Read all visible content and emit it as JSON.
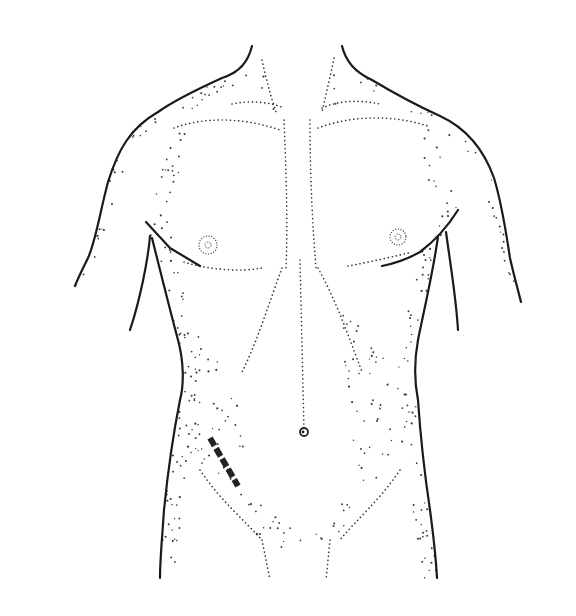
{
  "figure": {
    "type": "anatomical-illustration",
    "annotation": "dashed incision line, lower right abdomen (patient's right)",
    "colors": {
      "background": "#ffffff",
      "ink": "#1a1a1a",
      "stipple": "#3a3a3a",
      "incision": "#222222"
    },
    "outlines": {
      "left_shoulder": "M252 46 C 248 62, 240 72, 222 78 C 200 88, 175 100, 158 112 C 130 128, 118 150, 108 182 C 100 212, 96 240, 88 258 C 82 270, 78 278, 75 286",
      "right_shoulder": "M342 46 C 346 62, 355 72, 372 80 C 392 92, 418 106, 440 116 C 466 128, 484 150, 494 178 C 502 204, 506 232, 510 258 C 514 276, 518 290, 521 302",
      "left_axilla": "M146 222 L 170 248 L 200 266",
      "left_arm_inner": "M150 236 C 148 260, 140 300, 130 330",
      "left_flank": "M152 238 C 160 270, 170 310, 178 340 C 184 362, 184 385, 180 400 C 174 430, 168 470, 164 510 C 162 540, 160 560, 160 578",
      "right_axilla": "M458 210 C 448 226, 436 240, 420 252 C 406 260, 392 264, 382 266",
      "right_arm_inner": "M446 232 C 450 262, 456 296, 458 330",
      "right_flank": "M438 236 C 434 268, 424 310, 418 340 C 414 362, 414 380, 418 400 C 420 430, 424 470, 430 510 C 434 540, 436 560, 437 578"
    },
    "dotted_lines": {
      "left_clavicle": "M232 104 C 250 100, 270 102, 284 108",
      "right_clavicle": "M322 108 C 340 100, 360 100, 380 104",
      "left_pec_top": "M174 128 C 200 118, 240 116, 280 130",
      "right_pec_top": "M318 128 C 350 116, 390 114, 428 126",
      "sternum_left": "M284 120 C 286 170, 288 220, 286 268",
      "sternum_right": "M310 120 C 310 170, 312 220, 316 268",
      "left_pec_bottom": "M184 262 C 210 270, 240 272, 262 268",
      "right_pec_bottom": "M348 266 C 370 262, 396 256, 412 252",
      "costal_left": "M282 268 C 270 300, 258 340, 242 372",
      "costal_right": "M318 268 C 336 300, 350 340, 362 372",
      "linea_alba": "M300 260 L 304 430",
      "left_scm": "M262 60 C 266 78, 270 94, 276 112",
      "right_scm": "M334 58 C 330 78, 326 94, 322 112",
      "left_inguinal": "M200 470 C 220 500, 244 520, 262 540",
      "right_inguinal": "M400 470 C 380 500, 356 520, 340 540",
      "left_thigh": "M262 540 L 270 580",
      "right_thigh": "M330 540 L 326 580"
    },
    "nipples": [
      {
        "side": "left",
        "cx": 208,
        "cy": 245,
        "inner_r": 3,
        "outer_r": 9
      },
      {
        "side": "right",
        "cx": 398,
        "cy": 237,
        "inner_r": 3,
        "outer_r": 8
      }
    ],
    "navel": {
      "cx": 304,
      "cy": 432,
      "r": 4
    },
    "incision": {
      "start": [
        210,
        438
      ],
      "end": [
        238,
        486
      ],
      "segments": 5,
      "stroke_width": 6,
      "dasharray": "9 3"
    },
    "stipple_regions": [
      {
        "name": "left-shoulder-shade",
        "d": "M252 46 C 248 62, 240 72, 222 78 C 200 88, 175 100, 158 112 C 130 128, 118 150, 108 182 C 100 212, 96 240, 88 258 L 78 284 L 92 270 C 106 236, 116 196, 126 166 C 140 132, 190 110, 236 86 C 250 78, 256 64, 252 46 Z",
        "density": 0.55
      },
      {
        "name": "right-shoulder-shade",
        "d": "M342 46 C 346 62, 355 72, 372 80 C 392 92, 418 106, 440 116 C 466 128, 484 150, 494 178 C 502 204, 506 232, 510 258 L 520 300 L 504 270 C 496 236, 490 206, 480 180 C 470 152, 420 116, 372 92 C 352 80, 342 66, 342 46 Z",
        "density": 0.5
      },
      {
        "name": "left-flank-shade",
        "d": "M152 238 C 160 270, 170 310, 178 340 C 184 362, 184 385, 180 400 C 174 430, 168 470, 164 510 C 162 540, 160 560, 160 578 L 176 578 C 176 540, 182 500, 196 460 C 206 430, 204 380, 196 340 C 188 300, 180 270, 170 240 Z",
        "density": 0.6
      },
      {
        "name": "right-flank-shade",
        "d": "M438 236 C 434 268, 424 310, 418 340 C 414 362, 414 380, 418 400 C 420 430, 424 470, 430 510 C 434 540, 436 560, 437 578 L 420 578 C 418 540, 412 500, 404 460 C 396 420, 396 380, 402 340 C 410 300, 420 270, 424 240 Z",
        "density": 0.6
      },
      {
        "name": "left-pec-shade",
        "d": "M150 200 C 160 170, 170 140, 180 130 L 196 134 C 182 160, 170 200, 176 240 L 150 236 Z",
        "density": 0.5
      },
      {
        "name": "right-pec-shade",
        "d": "M428 126 C 440 150, 450 190, 458 210 L 440 240 C 432 210, 424 170, 412 140 Z",
        "density": 0.55
      },
      {
        "name": "lower-abdomen-shade",
        "d": "M230 470 C 250 500, 280 520, 300 530 C 320 520, 350 500, 370 470 C 380 450, 400 420, 410 400 C 396 440, 380 480, 340 540 C 320 560, 290 560, 262 540 C 240 520, 230 500, 230 470 Z",
        "density": 0.45
      },
      {
        "name": "right-abdomen-shade",
        "d": "M340 300 C 370 320, 400 350, 410 380 C 400 420, 380 460, 360 480 C 350 440, 345 380, 340 300 Z",
        "density": 0.35
      },
      {
        "name": "left-abdomen-shade",
        "d": "M196 330 C 220 360, 240 400, 250 440 C 240 470, 220 480, 200 470 C 196 420, 194 370, 196 330 Z",
        "density": 0.35
      },
      {
        "name": "neck-shade",
        "d": "M258 60 L 276 110 L 262 114 Z M336 60 L 322 110 L 336 114 Z",
        "density": 0.5
      }
    ]
  }
}
